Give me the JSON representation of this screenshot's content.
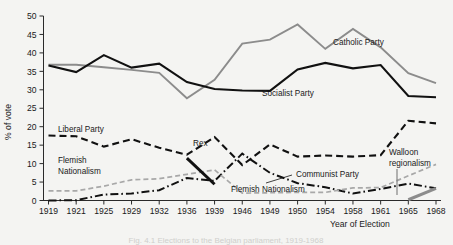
{
  "figure": {
    "caption": "Fig. 4.1 Elections to the Belgian parliament, 1919-1968",
    "ylabel": "% of vote",
    "xlabel": "Year of Election"
  },
  "chart_data": {
    "type": "line",
    "title": "",
    "xlabel": "Year of Election",
    "ylabel": "% of vote",
    "ylim": [
      0,
      50
    ],
    "ytick_step": 5,
    "grid": false,
    "legend_position": "inline-annotations",
    "categories": [
      "1919",
      "1921",
      "1925",
      "1929",
      "1932",
      "1936",
      "1939",
      "1946",
      "1949",
      "1950",
      "1954",
      "1958",
      "1961",
      "1965",
      "1968"
    ],
    "yticks": [
      "0",
      "5",
      "10",
      "15",
      "20",
      "25",
      "30",
      "35",
      "40",
      "45",
      "50"
    ],
    "series": [
      {
        "name": "Catholic Party",
        "style": "solid-grey",
        "color": "#8c8c8c",
        "label_x": 1949,
        "values": [
          36.8,
          36.8,
          36.1,
          35.4,
          34.6,
          27.7,
          32.7,
          42.5,
          43.6,
          47.7,
          41.1,
          46.5,
          41.5,
          34.5,
          31.8
        ]
      },
      {
        "name": "Socialist Party",
        "style": "solid-black",
        "color": "#111111",
        "label_x": 1939,
        "values": [
          36.6,
          34.8,
          39.4,
          36.0,
          37.1,
          32.1,
          30.2,
          29.8,
          29.7,
          35.5,
          37.3,
          35.8,
          36.7,
          28.3,
          28.0
        ]
      },
      {
        "name": "Liberal Party",
        "style": "dashed-black",
        "color": "#111111",
        "label_x": 1925,
        "values": [
          17.6,
          17.4,
          14.6,
          16.6,
          14.3,
          12.4,
          17.2,
          9.6,
          15.2,
          11.9,
          12.2,
          11.9,
          12.3,
          21.6,
          20.9
        ]
      },
      {
        "name": "Communist Party",
        "style": "dash-dot-black",
        "color": "#111111",
        "label_x": 1954,
        "values": [
          0.0,
          0.1,
          1.6,
          1.9,
          2.8,
          6.1,
          5.3,
          12.7,
          7.5,
          4.7,
          3.6,
          1.9,
          3.1,
          4.6,
          3.3
        ]
      },
      {
        "name": "Flemish Nationalism",
        "style": "dashed-grey",
        "color": "#a8a8a8",
        "label_x": 1932,
        "values": [
          2.6,
          2.6,
          3.9,
          5.6,
          5.9,
          7.1,
          8.3,
          2.0,
          2.1,
          2.2,
          2.2,
          3.4,
          3.5,
          6.7,
          9.8
        ]
      },
      {
        "name": "Rex",
        "style": "solid-black-thick",
        "color": "#111111",
        "label_x": 1936,
        "values": [
          null,
          null,
          null,
          null,
          null,
          11.5,
          4.4,
          null,
          null,
          null,
          null,
          null,
          null,
          null,
          null
        ]
      },
      {
        "name": "Walloon regionalism",
        "style": "solid-grey-thick",
        "color": "#8c8c8c",
        "label_x": 1965,
        "values": [
          null,
          null,
          null,
          null,
          null,
          null,
          null,
          null,
          null,
          null,
          null,
          null,
          null,
          0.2,
          3.3
        ]
      }
    ],
    "annotations": [
      {
        "name": "Catholic Party",
        "text": "Catholic Party"
      },
      {
        "name": "Socialist Party",
        "text": "Socialist Party"
      },
      {
        "name": "Liberal Party",
        "text": "Liberal Party"
      },
      {
        "name": "Communist Party",
        "text": "Communist Party"
      },
      {
        "name": "Flemish Nationalism left",
        "text": "Flemish"
      },
      {
        "name": "Flemish Nationalism left 2",
        "text": "Nationalism"
      },
      {
        "name": "Flemish Nationalism right",
        "text": "Flemish Nationalism"
      },
      {
        "name": "Rex",
        "text": "Rex"
      },
      {
        "name": "Walloon regionalism 1",
        "text": "Walloon"
      },
      {
        "name": "Walloon regionalism 2",
        "text": "regionalism"
      }
    ]
  },
  "labels": {
    "catholic": "Catholic Party",
    "socialist": "Socialist Party",
    "liberal": "Liberal Party",
    "communist": "Communist Party",
    "flemish_1": "Flemish",
    "flemish_2": "Nationalism",
    "flemish_right": "Flemish Nationalism",
    "rex": "Rex",
    "walloon_1": "Walloon",
    "walloon_2": "regionalism"
  },
  "ytick_labels": [
    "0",
    "5",
    "10",
    "15",
    "20",
    "25",
    "30",
    "35",
    "40",
    "45",
    "50"
  ],
  "xtick_labels": [
    "1919",
    "1921",
    "1925",
    "1929",
    "1932",
    "1936",
    "1939",
    "1946",
    "1949",
    "1950",
    "1954",
    "1958",
    "1961",
    "1965",
    "1968"
  ]
}
